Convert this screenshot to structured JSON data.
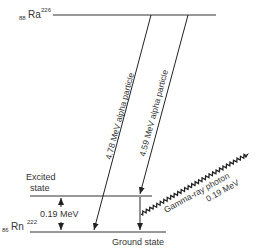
{
  "diagram": {
    "parent": {
      "z": "88",
      "symbol": "Ra",
      "a": "226"
    },
    "daughter": {
      "z": "86",
      "symbol": "Rn",
      "a": "222"
    },
    "excited_label_line1": "Excited",
    "excited_label_line2": "state",
    "ground_label": "Ground state",
    "gap_energy": "0.19 MeV",
    "alpha1": "4.78 MeV alpha particle",
    "alpha2": "4.59 MeV alpha particle",
    "gamma_line1": "Gamma-ray photon",
    "gamma_line2": "0.19 MeV"
  }
}
